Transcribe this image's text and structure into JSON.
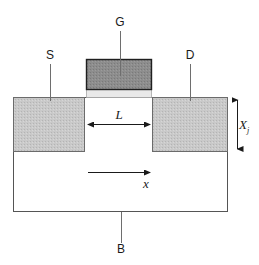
{
  "figure": {
    "width": 259,
    "height": 265,
    "background": "#ffffff"
  },
  "terminals": {
    "gate": {
      "label": "G",
      "x": 120,
      "y": 26
    },
    "source": {
      "label": "S",
      "x": 48,
      "y": 59
    },
    "drain": {
      "label": "D",
      "x": 188,
      "y": 59
    },
    "body": {
      "label": "B",
      "x": 121,
      "y": 252
    }
  },
  "dimensions": {
    "channel_length": {
      "label": "L",
      "x": 119,
      "y": 119
    },
    "junction_depth": {
      "label": "X",
      "subscript": "j",
      "x": 239,
      "y": 129
    },
    "axis": {
      "label": "x",
      "x": 146,
      "y": 188
    }
  },
  "regions": {
    "substrate": {
      "name": "substrate",
      "x": 13,
      "y": 97,
      "width": 215,
      "height": 115,
      "fill": "#ffffff",
      "stroke": "#555555"
    },
    "source_region": {
      "name": "source-diffusion",
      "x": 13,
      "y": 97,
      "width": 72,
      "height": 55,
      "fill": "#c9c9c9",
      "stroke": "#6b6b6b"
    },
    "drain_region": {
      "name": "drain-diffusion",
      "x": 152,
      "y": 97,
      "width": 76,
      "height": 55,
      "fill": "#c9c9c9",
      "stroke": "#6b6b6b"
    },
    "gate_electrode": {
      "name": "gate-electrode",
      "x": 86,
      "y": 59,
      "width": 66,
      "height": 31,
      "fill": "#8d8d8d",
      "stroke": "#1f1f1f"
    },
    "gate_oxide": {
      "name": "gate-oxide",
      "x": 86,
      "y": 90,
      "width": 66,
      "height": 7,
      "fill": "#e9e9e9",
      "stroke": "#9a9a9a"
    }
  },
  "colors": {
    "outline": "#555555",
    "diffusion_fill": "#c9c9c9",
    "gate_fill": "#8d8d8d",
    "oxide_fill": "#e9e9e9",
    "leader_line": "#6e6e6e",
    "arrow": "#1a1a1a",
    "text": "#1a1a1a"
  }
}
